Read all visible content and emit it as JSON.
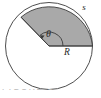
{
  "figure": {
    "name": "circular-sector-arc-length-diagram",
    "caption_fragment": "FIGURE 1",
    "colors": {
      "sector_fill": "#a9a9a9",
      "circle_fill": "#ffffff",
      "stroke": "#3a3a3a",
      "label": "#2b2b2b",
      "caption": "#b9b9b9",
      "background": "#ffffff"
    },
    "labels": {
      "arc_length": "s",
      "angle": "θ",
      "radius": "R"
    },
    "geometry": {
      "center_x": 49,
      "center_y": 46,
      "radius": 43.5,
      "sector_start_angle_deg": 0,
      "sector_end_angle_deg": 130,
      "angle_arc_radius": 14
    }
  }
}
